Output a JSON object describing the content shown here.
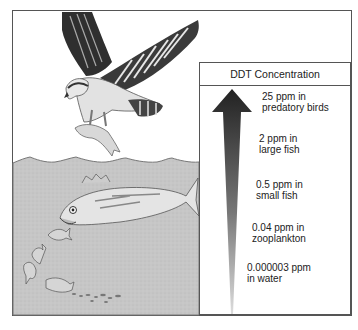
{
  "ghost_text": {
    "line1": "Concentrati",
    "line2": "Global W..."
  },
  "panel": {
    "title": "DDT Concentration",
    "levels": [
      {
        "line1": "25 ppm in",
        "line2": "predatory birds"
      },
      {
        "line1": "2 ppm in",
        "line2": "large fish"
      },
      {
        "line1": "0.5 ppm in",
        "line2": "small fish"
      },
      {
        "line1": "0.04 ppm in",
        "line2": "zooplankton"
      },
      {
        "line1": "0.000003 ppm",
        "line2": "in water"
      }
    ]
  },
  "scene": {
    "subjects": [
      "predatory-bird",
      "prey-fish",
      "large-fish",
      "small-fish",
      "zooplankton",
      "water"
    ]
  },
  "colors": {
    "water": "#c8c8c8",
    "frame": "#555555",
    "arrow_dark": "#2a2a2a",
    "arrow_light": "#d0d0d0"
  }
}
